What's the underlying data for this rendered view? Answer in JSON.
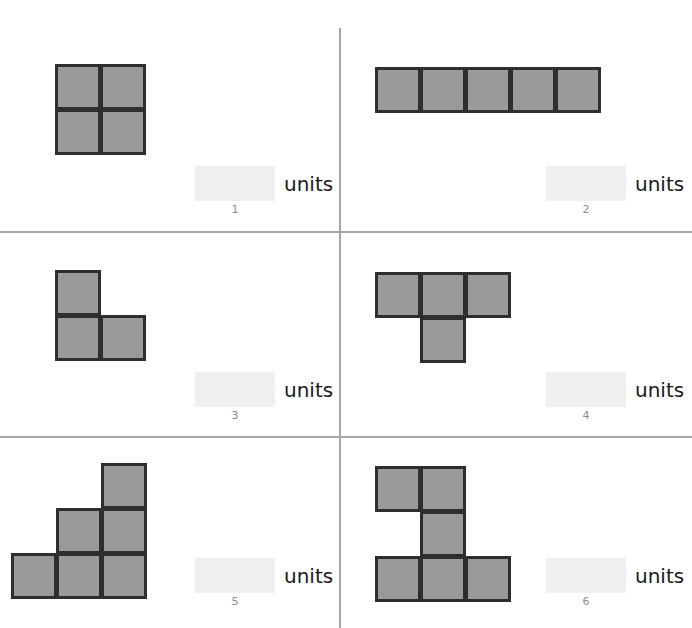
{
  "worksheet": {
    "title": "Count Unit Squares – Area Worksheet",
    "unit_label": "units",
    "background_color": "#ffffff",
    "divider_color": "#a6a6a6",
    "square_fill_color": "#9a9a9a",
    "square_border_color": "#2e2e2e",
    "answer_box_color": "#f0f0f0",
    "number_color": "#8c8c8c",
    "cell_size_px": 45
  },
  "dividers": {
    "vertical": [
      {
        "x": 339,
        "y": 28,
        "height": 600
      }
    ],
    "horizontal": [
      {
        "x": 0,
        "y": 231,
        "width": 692
      },
      {
        "x": 0,
        "y": 436,
        "width": 692
      }
    ]
  },
  "problems": [
    {
      "number": "1",
      "units_label": "units",
      "answer_value": "",
      "answer_placeholder": "",
      "shape_name": "two-by-two-square",
      "unit_count": 4,
      "columns": 2,
      "rows": 2,
      "cells": [
        [
          0,
          0
        ],
        [
          1,
          0
        ],
        [
          0,
          1
        ],
        [
          1,
          1
        ]
      ],
      "figure_left": 55,
      "figure_top": 64,
      "answer_left": 195,
      "answer_top": 166,
      "number_left": 195,
      "number_top": 203
    },
    {
      "number": "2",
      "units_label": "units",
      "answer_value": "",
      "answer_placeholder": "",
      "shape_name": "one-by-five-row",
      "unit_count": 5,
      "columns": 5,
      "rows": 1,
      "cells": [
        [
          0,
          0
        ],
        [
          1,
          0
        ],
        [
          2,
          0
        ],
        [
          3,
          0
        ],
        [
          4,
          0
        ]
      ],
      "figure_left": 375,
      "figure_top": 67,
      "answer_left": 546,
      "answer_top": 166,
      "number_left": 546,
      "number_top": 203
    },
    {
      "number": "3",
      "units_label": "units",
      "answer_value": "",
      "answer_placeholder": "",
      "shape_name": "l-shape",
      "unit_count": 3,
      "columns": 2,
      "rows": 2,
      "cells": [
        [
          0,
          0
        ],
        [
          0,
          1
        ],
        [
          1,
          1
        ]
      ],
      "figure_left": 55,
      "figure_top": 270,
      "answer_left": 195,
      "answer_top": 372,
      "number_left": 195,
      "number_top": 409
    },
    {
      "number": "4",
      "units_label": "units",
      "answer_value": "",
      "answer_placeholder": "",
      "shape_name": "t-shape",
      "unit_count": 4,
      "columns": 3,
      "rows": 2,
      "cells": [
        [
          0,
          0
        ],
        [
          1,
          0
        ],
        [
          2,
          0
        ],
        [
          1,
          1
        ]
      ],
      "figure_left": 375,
      "figure_top": 272,
      "answer_left": 546,
      "answer_top": 372,
      "number_left": 546,
      "number_top": 409
    },
    {
      "number": "5",
      "units_label": "units",
      "answer_value": "",
      "answer_placeholder": "",
      "shape_name": "staircase-shape",
      "unit_count": 6,
      "columns": 3,
      "rows": 3,
      "cells": [
        [
          2,
          0
        ],
        [
          1,
          1
        ],
        [
          2,
          1
        ],
        [
          0,
          2
        ],
        [
          1,
          2
        ],
        [
          2,
          2
        ]
      ],
      "figure_left": 11,
      "figure_top": 463,
      "answer_left": 195,
      "answer_top": 558,
      "number_left": 195,
      "number_top": 595
    },
    {
      "number": "6",
      "units_label": "units",
      "answer_value": "",
      "answer_placeholder": "",
      "shape_name": "z-shape",
      "unit_count": 6,
      "columns": 3,
      "rows": 3,
      "cells": [
        [
          0,
          0
        ],
        [
          1,
          0
        ],
        [
          1,
          1
        ],
        [
          0,
          2
        ],
        [
          1,
          2
        ],
        [
          2,
          2
        ]
      ],
      "figure_left": 375,
      "figure_top": 466,
      "answer_left": 546,
      "answer_top": 558,
      "number_left": 546,
      "number_top": 595
    }
  ]
}
